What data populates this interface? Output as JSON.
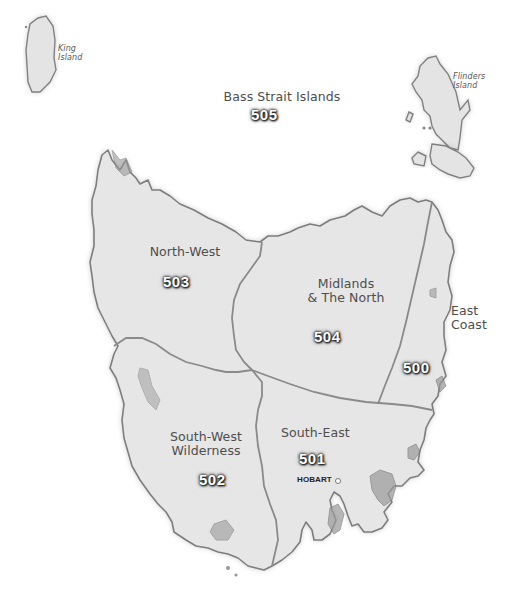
{
  "map": {
    "title": "Tasmania regions map",
    "regions": [
      {
        "name": "Bass Strait Islands",
        "code": "505"
      },
      {
        "name": "North-West",
        "code": "503"
      },
      {
        "name": "Midlands & The North",
        "name_line1": "Midlands",
        "name_line2": "& The North",
        "code": "504"
      },
      {
        "name": "East Coast",
        "name_line1": "East",
        "name_line2": "Coast",
        "code": "500"
      },
      {
        "name": "South-West Wilderness",
        "name_line1": "South-West",
        "name_line2": "Wilderness",
        "code": "502"
      },
      {
        "name": "South-East",
        "code": "501"
      }
    ],
    "islands": [
      {
        "name": "King Island",
        "line1": "King",
        "line2": "Island"
      },
      {
        "name": "Flinders Island",
        "line1": "Flinders",
        "line2": "Island"
      }
    ],
    "cities": [
      {
        "name": "HOBART"
      }
    ],
    "colors": {
      "land": "#e6e6e6",
      "coast": "#7d7d7d",
      "border": "#8a8a8a",
      "label_text": "#4d4d4d",
      "code_text": "#ffffff",
      "background": "#ffffff"
    }
  }
}
